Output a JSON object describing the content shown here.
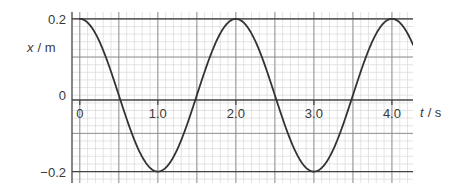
{
  "chart_data": {
    "type": "line",
    "title": "",
    "subtitle": "",
    "xlabel": "t / s",
    "xlabel_symbol": "t",
    "xlabel_unit": "/ s",
    "ylabel": "x / m",
    "ylabel_symbol": "x",
    "ylabel_unit": "/ m",
    "xlim": [
      -0.1,
      4.27
    ],
    "ylim": [
      -0.23,
      0.218
    ],
    "xticks": [
      0,
      1.0,
      2.0,
      3.0,
      4.0
    ],
    "xticklabels": [
      "0",
      "1.0",
      "2.0",
      "3.0",
      "4.0"
    ],
    "yticks": [
      0.2,
      0,
      -0.2
    ],
    "yticklabels": [
      "0.2",
      "0",
      "−0.2"
    ],
    "grid": true,
    "grid_major_spacing_x": 0.5,
    "grid_major_spacing_y": 0.1,
    "grid_minor_spacing_x": 0.1,
    "grid_minor_spacing_y": 0.02,
    "legend": null,
    "legend_position": "none",
    "series": [
      {
        "name": "displacement",
        "equation": "x = 0.2 cos(π t)",
        "amplitude": 0.2,
        "period": 2.0,
        "phase": 0,
        "color": "#333333",
        "linewidth": 1.8,
        "x": [
          0,
          0.1,
          0.2,
          0.3,
          0.4,
          0.5,
          0.6,
          0.7,
          0.8,
          0.9,
          1.0,
          1.1,
          1.2,
          1.3,
          1.4,
          1.5,
          1.6,
          1.7,
          1.8,
          1.9,
          2.0,
          2.1,
          2.2,
          2.3,
          2.4,
          2.5,
          2.6,
          2.7,
          2.8,
          2.9,
          3.0,
          3.1,
          3.2,
          3.3,
          3.4,
          3.5,
          3.6,
          3.7,
          3.8,
          3.9,
          4.0,
          4.1,
          4.2,
          4.27
        ],
        "y": [
          0.2,
          0.19,
          0.162,
          0.118,
          0.062,
          0.0,
          -0.062,
          -0.118,
          -0.162,
          -0.19,
          -0.2,
          -0.19,
          -0.162,
          -0.118,
          -0.062,
          0.0,
          0.062,
          0.118,
          0.162,
          0.19,
          0.2,
          0.19,
          0.162,
          0.118,
          0.062,
          0.0,
          -0.062,
          -0.118,
          -0.162,
          -0.19,
          -0.2,
          -0.19,
          -0.162,
          -0.118,
          -0.062,
          0.0,
          0.062,
          0.118,
          0.162,
          0.19,
          0.2,
          0.19,
          0.162,
          0.141
        ]
      }
    ],
    "annotations": [],
    "colors": {
      "curve": "#333333",
      "axis": "#444444",
      "grid_major": "#8a8a8a",
      "grid_minor": "#d8d8d8",
      "text": "#3a3a3a",
      "background": "#ffffff"
    }
  }
}
